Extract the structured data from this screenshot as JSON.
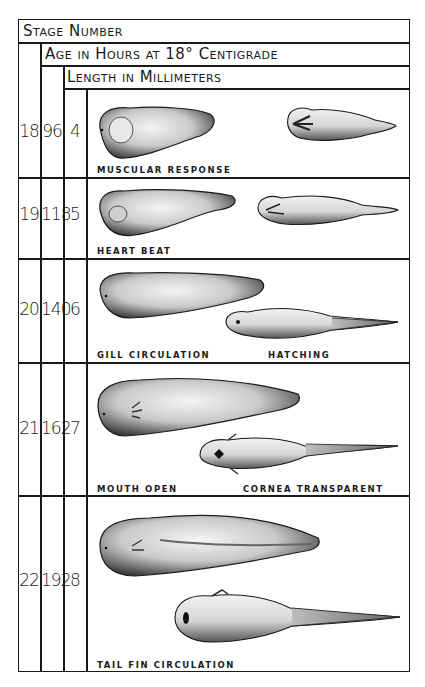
{
  "headers": {
    "stage_number": "Stage Number",
    "age": "Age in Hours at 18° Centigrade",
    "length": "Length in Millimeters"
  },
  "rows": [
    {
      "stage": "18",
      "hours": "96",
      "length": "4",
      "labels": [
        "MUSCULAR  RESPONSE"
      ]
    },
    {
      "stage": "19",
      "hours": "118",
      "length": "5",
      "labels": [
        "HEART  BEAT"
      ]
    },
    {
      "stage": "20",
      "hours": "140",
      "length": "6",
      "labels": [
        "GILL  CIRCULATION",
        "HATCHING"
      ]
    },
    {
      "stage": "21",
      "hours": "162",
      "length": "7",
      "labels": [
        "MOUTH  OPEN",
        "CORNEA  TRANSPARENT"
      ]
    },
    {
      "stage": "22",
      "hours": "192",
      "length": "8",
      "labels": [
        "TAIL  FIN  CIRCULATION"
      ]
    }
  ],
  "illustrations": [
    {
      "stage": "18",
      "views": [
        "lateral-embryo",
        "ventral-embryo"
      ]
    },
    {
      "stage": "19",
      "views": [
        "lateral-embryo",
        "ventral-embryo"
      ]
    },
    {
      "stage": "20",
      "views": [
        "lateral-tadpole",
        "ventral-tadpole"
      ]
    },
    {
      "stage": "21",
      "views": [
        "lateral-tadpole",
        "ventral-tadpole"
      ]
    },
    {
      "stage": "22",
      "views": [
        "lateral-tadpole",
        "ventral-tadpole"
      ]
    }
  ]
}
